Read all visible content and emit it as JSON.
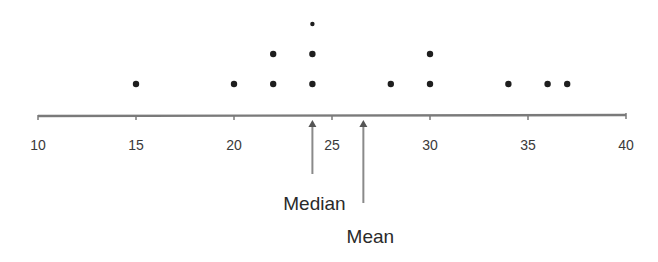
{
  "chart_data": {
    "type": "scatter",
    "subtype": "dot_plot",
    "title": "",
    "xlabel": "",
    "ylabel": "",
    "xlim": [
      10,
      40
    ],
    "x_ticks": [
      10,
      15,
      20,
      25,
      30,
      35,
      40
    ],
    "x_tick_labels": [
      "10",
      "15",
      "20",
      "25",
      "30",
      "35",
      "40"
    ],
    "grid": false,
    "legend": null,
    "points": [
      {
        "value": 15,
        "count": 1
      },
      {
        "value": 20,
        "count": 1
      },
      {
        "value": 22,
        "count": 2
      },
      {
        "value": 24,
        "count": 3
      },
      {
        "value": 28,
        "count": 1
      },
      {
        "value": 30,
        "count": 2
      },
      {
        "value": 34,
        "count": 1
      },
      {
        "value": 36,
        "count": 1
      },
      {
        "value": 37,
        "count": 1
      }
    ],
    "data": [
      15,
      20,
      22,
      22,
      24,
      24,
      24,
      28,
      30,
      30,
      34,
      36,
      37
    ],
    "annotations": [
      {
        "label": "Median",
        "value": 24
      },
      {
        "label": "Mean",
        "value": 26.6
      }
    ]
  },
  "colors": {
    "dot": "#1e1e1e",
    "axis": "#7a7a7a",
    "text": "#3a3a3a",
    "arrow": "#8a8a8a"
  }
}
